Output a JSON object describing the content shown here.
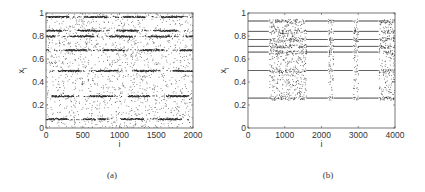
{
  "chart_data": [
    {
      "id": "a",
      "type": "scatter",
      "caption": "(a)",
      "title": "",
      "xlabel": "i",
      "ylabel": "x_i",
      "xlim": [
        0,
        2000
      ],
      "ylim": [
        0,
        1
      ],
      "xticks": [
        0,
        500,
        1000,
        1500,
        2000
      ],
      "yticks": [
        0,
        0.2,
        0.4,
        0.6,
        0.8,
        1
      ],
      "ytick_labels": [
        "0",
        "0.2",
        "0.4",
        "0.6",
        "0.8",
        "1"
      ],
      "grid": false,
      "description": "Intermittent chaos: dense scattered points with periodic-window dashed bands",
      "band_levels": [
        0.97,
        0.85,
        0.8,
        0.68,
        0.5,
        0.28,
        0.08
      ],
      "periodic_windows": [
        [
          0,
          120
        ],
        [
          180,
          650
        ],
        [
          1200,
          1300
        ],
        [
          1650,
          1720
        ],
        [
          1920,
          2000
        ]
      ],
      "frame": {
        "left": 46,
        "top": 13,
        "right": 193,
        "bottom": 128
      }
    },
    {
      "id": "b",
      "type": "scatter",
      "caption": "(b)",
      "title": "",
      "xlabel": "i",
      "ylabel": "x_i",
      "xlim": [
        0,
        4000
      ],
      "ylim": [
        0,
        1
      ],
      "xticks": [
        0,
        1000,
        2000,
        3000,
        4000
      ],
      "yticks": [
        0,
        0.2,
        0.4,
        0.6,
        0.8,
        1
      ],
      "ytick_labels": [
        "0",
        "0.2",
        "0.4",
        "0.6",
        "0.8",
        "1"
      ],
      "grid": false,
      "description": "Periodic orbit levels interrupted by chaotic bursts",
      "line_levels": [
        0.93,
        0.84,
        0.77,
        0.71,
        0.66,
        0.5,
        0.26
      ],
      "chaotic_bursts": [
        [
          570,
          1580
        ],
        [
          2180,
          2320
        ],
        [
          2860,
          3000
        ],
        [
          3560,
          4000
        ]
      ],
      "frame": {
        "left": 36,
        "top": 13,
        "right": 183,
        "bottom": 128
      }
    }
  ]
}
